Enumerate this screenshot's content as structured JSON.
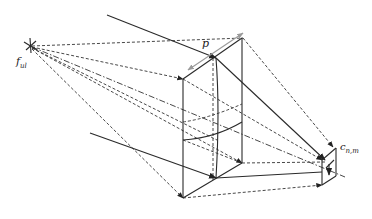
{
  "figure": {
    "type": "optical projection diagram",
    "labels": {
      "focal_point": "f",
      "focal_point_sub": "ul",
      "thickness": "p",
      "target_cell": "c",
      "target_cell_sub": "n,m"
    },
    "caption": "",
    "colors": {
      "line": "#2a2a2a",
      "dimension_arrow": "#9a9a9a",
      "background": "#ffffff"
    }
  }
}
